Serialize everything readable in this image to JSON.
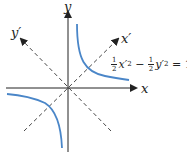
{
  "axes": {
    "x_label": "x",
    "y_label": "y",
    "x_prime_label": "x′",
    "y_prime_label": "y′"
  },
  "equation": {
    "frac1_num": "1",
    "frac1_den": "2",
    "term1_var": "x′",
    "term1_exp": "2",
    "minus": " − ",
    "frac2_num": "1",
    "frac2_den": "2",
    "term2_var": "y′",
    "term2_exp": "2",
    "rhs": " = 1"
  },
  "colors": {
    "curve": "#4a86c8",
    "axis": "#222222"
  }
}
